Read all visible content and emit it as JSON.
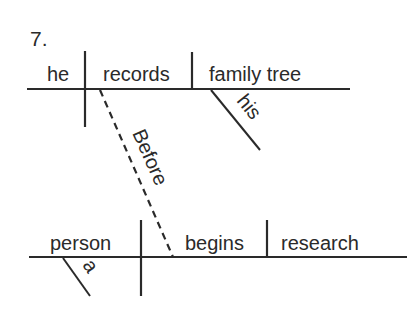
{
  "diagram": {
    "number": "7.",
    "line_color": "#2a2a2a",
    "main_clause": {
      "subject": "he",
      "verb": "records",
      "object": "family tree",
      "object_modifier": "his"
    },
    "connector": {
      "word": "Before",
      "style": "dashed"
    },
    "subordinate_clause": {
      "subject": "person",
      "subject_modifier": "a",
      "verb": "begins",
      "object": "research"
    }
  }
}
